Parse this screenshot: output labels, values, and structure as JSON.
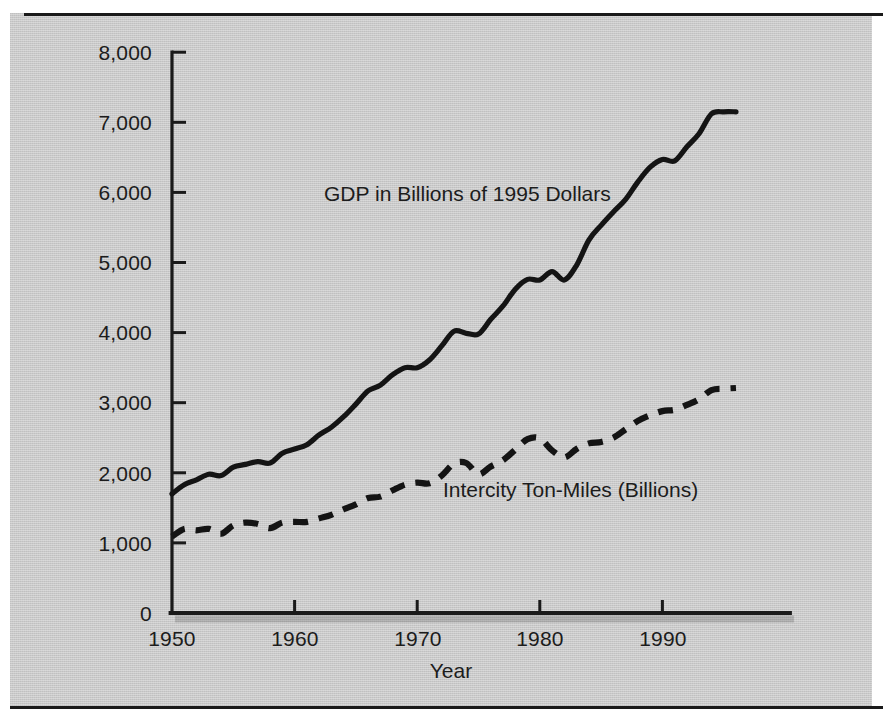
{
  "figure": {
    "background_color": "#c9c9c9",
    "ink_color": "#1a1a1a"
  },
  "axes": {
    "x_title": "Year",
    "y_tick_labels": [
      "8,000",
      "7,000",
      "6,000",
      "5,000",
      "4,000",
      "3,000",
      "2,000",
      "1,000",
      "0"
    ],
    "x_tick_labels": [
      "1950",
      "1960",
      "1970",
      "1980",
      "1990"
    ]
  },
  "annotations": {
    "gdp_label": "GDP in Billions of 1995 Dollars",
    "tonmiles_label": "Intercity Ton-Miles (Billions)"
  },
  "chart_data": {
    "type": "line",
    "title": "",
    "subtitle": "",
    "xlabel": "Year",
    "ylabel": "",
    "xlim": [
      1950,
      1997
    ],
    "ylim": [
      0,
      8000
    ],
    "grid": false,
    "legend_position": "inline-annotation",
    "xticks": [
      1950,
      1960,
      1970,
      1980,
      1990
    ],
    "yticks": [
      0,
      1000,
      2000,
      3000,
      4000,
      5000,
      6000,
      7000,
      8000
    ],
    "x": [
      1950,
      1951,
      1952,
      1953,
      1954,
      1955,
      1956,
      1957,
      1958,
      1959,
      1960,
      1961,
      1962,
      1963,
      1964,
      1965,
      1966,
      1967,
      1968,
      1969,
      1970,
      1971,
      1972,
      1973,
      1974,
      1975,
      1976,
      1977,
      1978,
      1979,
      1980,
      1981,
      1982,
      1983,
      1984,
      1985,
      1986,
      1987,
      1988,
      1989,
      1990,
      1991,
      1992,
      1993,
      1994,
      1995,
      1996
    ],
    "series": [
      {
        "name": "GDP in Billions of 1995 Dollars",
        "style": "solid",
        "color": "#141414",
        "values": [
          1700,
          1830,
          1900,
          1980,
          1960,
          2080,
          2120,
          2160,
          2140,
          2280,
          2340,
          2400,
          2540,
          2650,
          2800,
          2980,
          3170,
          3250,
          3400,
          3500,
          3500,
          3610,
          3810,
          4020,
          3990,
          3980,
          4190,
          4380,
          4620,
          4760,
          4750,
          4870,
          4750,
          4960,
          5320,
          5530,
          5720,
          5900,
          6150,
          6360,
          6470,
          6450,
          6650,
          6840,
          7120,
          7150,
          7150
        ]
      },
      {
        "name": "Intercity Ton-Miles (Billions)",
        "style": "dashed",
        "color": "#141414",
        "values": [
          1090,
          1200,
          1180,
          1200,
          1130,
          1250,
          1290,
          1270,
          1210,
          1290,
          1300,
          1300,
          1350,
          1400,
          1480,
          1550,
          1640,
          1660,
          1750,
          1830,
          1860,
          1850,
          1960,
          2130,
          2140,
          1980,
          2090,
          2180,
          2330,
          2480,
          2490,
          2320,
          2220,
          2340,
          2420,
          2440,
          2500,
          2620,
          2740,
          2820,
          2880,
          2900,
          2970,
          3050,
          3180,
          3200,
          3210
        ]
      }
    ]
  },
  "layout": {
    "plot_left_px": 172,
    "plot_right_px": 790,
    "plot_bottom_px": 613,
    "plot_top_px": 52,
    "year_min": 1950,
    "year_max": 1996,
    "px_per_year": 12.26,
    "px_per_1000": 70.1
  }
}
